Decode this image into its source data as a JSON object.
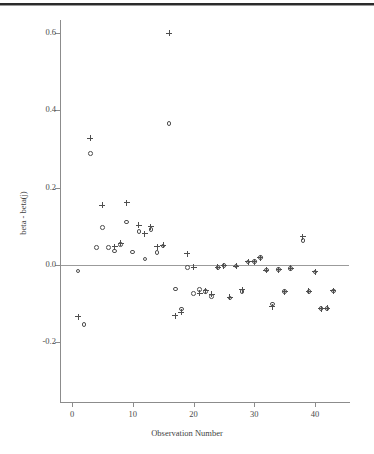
{
  "figure": {
    "background_color": "#ffffff",
    "axis_color": "#8c8c8c",
    "marker_color": "#4e4e4e",
    "top_rule_color": "#2b2b2b"
  },
  "chart_data": {
    "type": "scatter",
    "title": "",
    "xlabel": "Observation Number",
    "ylabel": "beta - beta(j)",
    "xlim": [
      -1.5,
      45.5
    ],
    "ylim": [
      -0.29,
      0.66
    ],
    "xticks": [
      0,
      10,
      20,
      30,
      40
    ],
    "xtick_labels": [
      "0",
      "10",
      "20",
      "30",
      "40"
    ],
    "yticks": [
      -0.2,
      0.0,
      0.2,
      0.4,
      0.6
    ],
    "ytick_labels": [
      "-0.2",
      "0.0",
      "0.2",
      "0.4",
      "0.6"
    ],
    "grid": false,
    "legend": null,
    "reference_line": {
      "y": 0.0,
      "color": "#9b9b9b"
    },
    "series": [
      {
        "name": "plus",
        "marker": "plus",
        "x": [
          1,
          3,
          5,
          7,
          8,
          9,
          11,
          12,
          13,
          14,
          15,
          16,
          17,
          18,
          19,
          20,
          21,
          22,
          23,
          24,
          25,
          26,
          27,
          28,
          29,
          30,
          31,
          32,
          33,
          34,
          35,
          36,
          38,
          39,
          40,
          41,
          42,
          43
        ],
        "y": [
          -0.134,
          0.328,
          0.154,
          0.047,
          0.056,
          0.161,
          0.103,
          0.081,
          0.099,
          0.047,
          0.051,
          0.599,
          -0.131,
          -0.122,
          0.029,
          -0.006,
          -0.073,
          -0.066,
          -0.076,
          -0.006,
          -0.002,
          -0.083,
          -0.003,
          -0.064,
          0.008,
          0.009,
          0.019,
          -0.013,
          -0.108,
          -0.012,
          -0.069,
          -0.009,
          0.073,
          -0.068,
          -0.018,
          -0.113,
          -0.112,
          -0.067
        ]
      },
      {
        "name": "circle",
        "marker": "circle",
        "x": [
          1,
          2,
          3,
          4,
          5,
          6,
          7,
          8,
          9,
          10,
          11,
          12,
          13,
          14,
          15,
          16,
          17,
          18,
          19,
          20,
          21,
          22,
          23,
          24,
          25,
          26,
          27,
          28,
          29,
          30,
          31,
          32,
          33,
          34,
          35,
          36,
          38,
          39,
          40,
          41,
          42,
          43
        ],
        "y": [
          -0.015,
          -0.154,
          0.288,
          0.046,
          0.097,
          0.046,
          0.036,
          0.053,
          0.111,
          0.034,
          0.086,
          0.016,
          0.092,
          0.033,
          0.049,
          0.366,
          -0.062,
          -0.114,
          -0.006,
          -0.073,
          -0.063,
          -0.068,
          -0.081,
          -0.006,
          -0.002,
          -0.085,
          -0.003,
          -0.069,
          0.008,
          0.009,
          0.019,
          -0.013,
          -0.101,
          -0.012,
          -0.069,
          -0.009,
          0.063,
          -0.068,
          -0.018,
          -0.113,
          -0.112,
          -0.067
        ]
      }
    ]
  }
}
